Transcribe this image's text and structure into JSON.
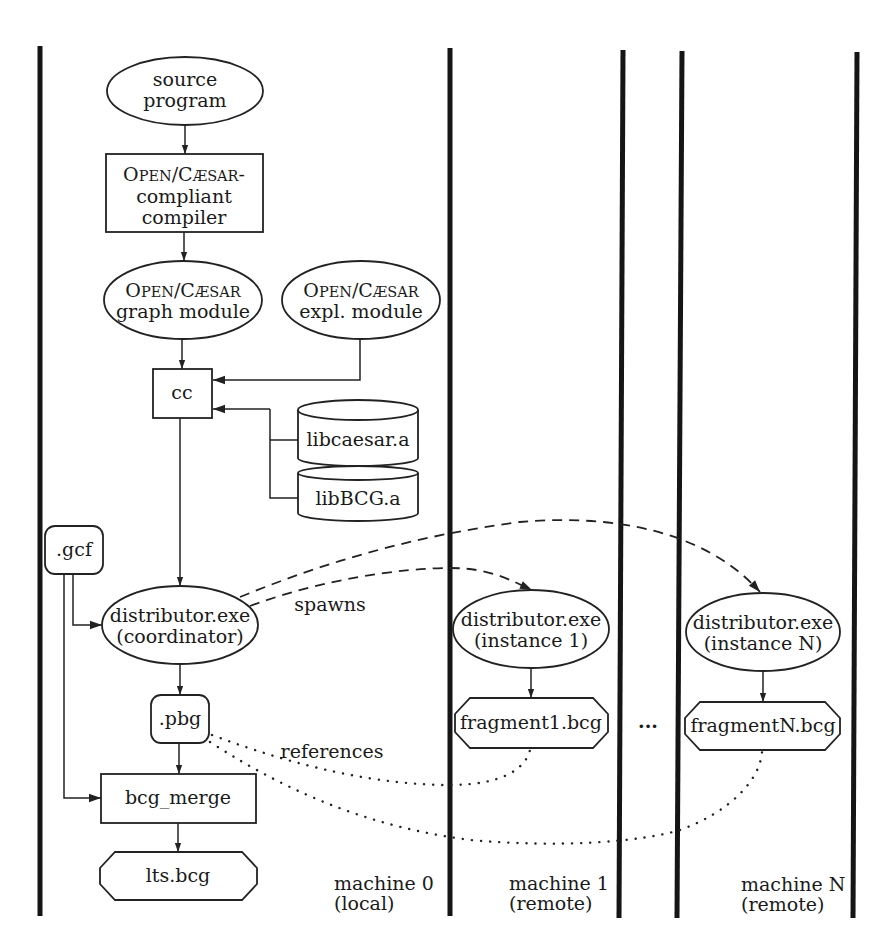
{
  "diagram": {
    "nodes": {
      "source_program": {
        "line1": "source",
        "line2": "program",
        "shape": "ellipse"
      },
      "compiler": {
        "line1_cap": "O",
        "line1_small": "PEN",
        "line1_sep": "/",
        "line1_cap2": "C",
        "line1_small2": "ÆSAR",
        "line1_suffix": "-",
        "line2": "compliant",
        "line3": "compiler",
        "shape": "rectangle"
      },
      "graph_module": {
        "line1_cap": "O",
        "line1_small": "PEN",
        "line1_sep": "/",
        "line1_cap2": "C",
        "line1_small2": "ÆSAR",
        "line2": "graph module",
        "shape": "ellipse"
      },
      "expl_module": {
        "line1_cap": "O",
        "line1_small": "PEN",
        "line1_sep": "/",
        "line1_cap2": "C",
        "line1_small2": "ÆSAR",
        "line2": "expl. module",
        "shape": "ellipse"
      },
      "cc": {
        "label": "cc",
        "shape": "rectangle"
      },
      "libcaesar": {
        "label": "libcaesar.a",
        "shape": "cylinder"
      },
      "libbcg": {
        "label": "libBCG.a",
        "shape": "cylinder"
      },
      "gcf": {
        "label": ".gcf",
        "shape": "rounded-rectangle"
      },
      "coordinator": {
        "line1": "distributor.exe",
        "line2": "(coordinator)",
        "shape": "ellipse"
      },
      "instance1": {
        "line1": "distributor.exe",
        "line2": "(instance 1)",
        "shape": "ellipse"
      },
      "instanceN": {
        "line1": "distributor.exe",
        "line2": "(instance N)",
        "shape": "ellipse"
      },
      "pbg": {
        "label": ".pbg",
        "shape": "rounded-rectangle"
      },
      "fragment1": {
        "label": "fragment1.bcg",
        "shape": "hexagon"
      },
      "fragmentN": {
        "label": "fragmentN.bcg",
        "shape": "hexagon"
      },
      "bcg_merge": {
        "label": "bcg_merge",
        "shape": "rectangle"
      },
      "lts": {
        "label": "lts.bcg",
        "shape": "hexagon"
      }
    },
    "edge_labels": {
      "spawns": "spawns",
      "references": "references",
      "ellipsis": "..."
    },
    "machines": [
      {
        "name": "machine 0",
        "kind": "(local)"
      },
      {
        "name": "machine 1",
        "kind": "(remote)"
      },
      {
        "name": "machine N",
        "kind": "(remote)"
      }
    ],
    "colors": {
      "stroke": "#222222",
      "background": "#ffffff",
      "text": "#1a1a1a"
    }
  }
}
